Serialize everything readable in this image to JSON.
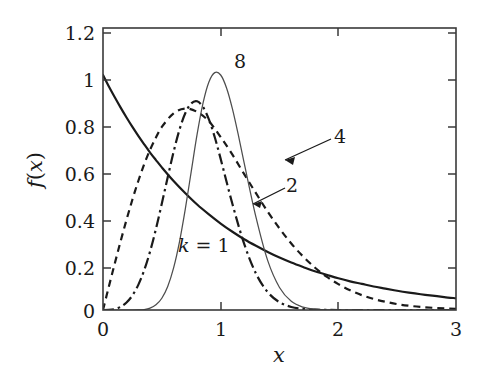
{
  "chart_data": {
    "type": "line",
    "title": "",
    "xlabel": "x",
    "ylabel": "f(x)",
    "xlim": [
      0,
      3
    ],
    "ylim": [
      0,
      1.2
    ],
    "xticks": [
      "0",
      "1",
      "2",
      "3"
    ],
    "xtick_values": [
      0,
      1,
      2,
      3
    ],
    "yticks": [
      "0",
      "0.2",
      "0.4",
      "0.6",
      "0.8",
      "1",
      "1.2"
    ],
    "ytick_values": [
      0,
      0.2,
      0.4,
      0.6,
      0.8,
      1.0,
      1.2
    ],
    "grid": false,
    "legend": "inline-annotations",
    "annotations": [
      {
        "text": "k = 1",
        "x": 0.75,
        "y": 0.28,
        "style": "italic-k"
      },
      {
        "text": "2",
        "x": 1.63,
        "y": 0.54,
        "arrow_to_x": 1.28,
        "arrow_to_y": 0.43
      },
      {
        "text": "4",
        "x": 2.04,
        "y": 0.72,
        "arrow_to_x": 1.44,
        "arrow_to_y": 0.61
      },
      {
        "text": "8",
        "x": 1.14,
        "y": 1.06
      }
    ],
    "series": [
      {
        "name": "k = 1",
        "label": "1",
        "linestyle": "solid",
        "color": "#1a1a1a",
        "width": 2.2,
        "x": [
          0,
          0.05,
          0.1,
          0.15,
          0.2,
          0.25,
          0.3,
          0.35,
          0.4,
          0.45,
          0.5,
          0.6,
          0.7,
          0.8,
          0.9,
          1.0,
          1.1,
          1.2,
          1.3,
          1.4,
          1.5,
          1.6,
          1.7,
          1.8,
          1.9,
          2.0,
          2.1,
          2.2,
          2.3,
          2.4,
          2.5,
          2.6,
          2.7,
          2.8,
          2.9,
          3.0
        ],
        "y": [
          1.0,
          0.951,
          0.905,
          0.861,
          0.819,
          0.779,
          0.741,
          0.705,
          0.67,
          0.638,
          0.607,
          0.549,
          0.497,
          0.449,
          0.407,
          0.368,
          0.333,
          0.301,
          0.273,
          0.247,
          0.223,
          0.202,
          0.183,
          0.165,
          0.15,
          0.135,
          0.122,
          0.111,
          0.1,
          0.091,
          0.082,
          0.074,
          0.067,
          0.061,
          0.055,
          0.05
        ]
      },
      {
        "name": "k = 2",
        "label": "2",
        "linestyle": "dashed",
        "color": "#1a1a1a",
        "width": 2.2,
        "x": [
          0,
          0.05,
          0.1,
          0.15,
          0.2,
          0.25,
          0.3,
          0.35,
          0.4,
          0.45,
          0.5,
          0.6,
          0.7,
          0.8,
          0.9,
          1.0,
          1.1,
          1.2,
          1.3,
          1.4,
          1.5,
          1.6,
          1.7,
          1.8,
          1.9,
          2.0,
          2.1,
          2.2,
          2.3,
          2.4,
          2.5,
          2.6,
          2.7,
          2.8,
          2.9,
          3.0
        ],
        "y": [
          0.0,
          0.1,
          0.198,
          0.293,
          0.384,
          0.47,
          0.549,
          0.62,
          0.682,
          0.734,
          0.779,
          0.837,
          0.857,
          0.843,
          0.803,
          0.736,
          0.661,
          0.578,
          0.497,
          0.418,
          0.347,
          0.283,
          0.228,
          0.181,
          0.142,
          0.11,
          0.084,
          0.063,
          0.047,
          0.035,
          0.025,
          0.018,
          0.013,
          0.0095,
          0.0067,
          0.0047
        ]
      },
      {
        "name": "k = 4",
        "label": "4",
        "linestyle": "dashdot",
        "color": "#1a1a1a",
        "width": 2.2,
        "x": [
          0,
          0.05,
          0.1,
          0.15,
          0.2,
          0.25,
          0.3,
          0.35,
          0.4,
          0.45,
          0.5,
          0.55,
          0.6,
          0.65,
          0.7,
          0.75,
          0.8,
          0.85,
          0.9,
          0.95,
          1.0,
          1.1,
          1.2,
          1.3,
          1.4,
          1.5,
          1.6,
          1.7,
          1.8,
          1.9,
          2.0,
          2.2,
          2.4,
          2.6,
          2.8,
          3.0
        ],
        "y": [
          0.0,
          0.0005,
          0.004,
          0.0135,
          0.032,
          0.062,
          0.107,
          0.169,
          0.249,
          0.345,
          0.453,
          0.565,
          0.673,
          0.767,
          0.838,
          0.879,
          0.888,
          0.864,
          0.811,
          0.735,
          0.643,
          0.451,
          0.281,
          0.155,
          0.076,
          0.033,
          0.013,
          0.0045,
          0.0014,
          0.0004,
          0.0001,
          1e-05,
          0.0,
          0.0,
          0.0,
          0.0
        ]
      },
      {
        "name": "k = 8",
        "label": "8",
        "linestyle": "solid-thin",
        "color": "#4d4d4d",
        "width": 1.2,
        "x": [
          0,
          0.1,
          0.2,
          0.25,
          0.3,
          0.35,
          0.4,
          0.45,
          0.5,
          0.55,
          0.6,
          0.65,
          0.7,
          0.75,
          0.8,
          0.85,
          0.9,
          0.95,
          1.0,
          1.05,
          1.1,
          1.15,
          1.2,
          1.3,
          1.4,
          1.5,
          1.6,
          1.7,
          1.8,
          1.9,
          2.0,
          2.2,
          2.4,
          2.6,
          2.8,
          3.0
        ],
        "y": [
          0.0,
          0.0,
          0.0,
          0.0,
          0.0005,
          0.002,
          0.008,
          0.022,
          0.05,
          0.1,
          0.179,
          0.29,
          0.431,
          0.59,
          0.748,
          0.88,
          0.97,
          1.01,
          1.0,
          0.945,
          0.856,
          0.745,
          0.625,
          0.395,
          0.21,
          0.096,
          0.037,
          0.012,
          0.0034,
          0.0008,
          0.0002,
          1e-05,
          0.0,
          0.0,
          0.0,
          0.0
        ]
      }
    ]
  },
  "axes": {
    "x_label": "x",
    "y_label_f": "f",
    "y_label_paren_open": "(",
    "y_label_var": "x",
    "y_label_paren_close": ")",
    "x_tick_0": "0",
    "x_tick_1": "1",
    "x_tick_2": "2",
    "x_tick_3": "3",
    "y_tick_0": "0",
    "y_tick_02": "0.2",
    "y_tick_04": "0.4",
    "y_tick_06": "0.6",
    "y_tick_08": "0.8",
    "y_tick_1": "1",
    "y_tick_12": "1.2"
  },
  "labels": {
    "k_equals_1": "k = 1",
    "k_1_sym": "k",
    "k_1_rest": " = 1",
    "curve_2": "2",
    "curve_4": "4",
    "curve_8": "8"
  },
  "colors": {
    "frame": "#3a3a3a",
    "curve": "#1a1a1a",
    "curve_thin": "#4d4d4d",
    "background": "#ffffff",
    "text": "#1a1a1a"
  }
}
